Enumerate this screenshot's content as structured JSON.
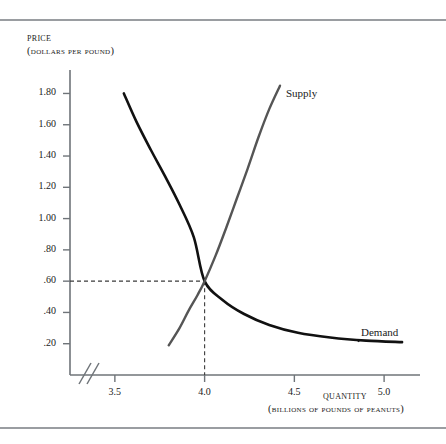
{
  "chart_data": {
    "type": "line",
    "title": "",
    "xlabel": "Quantity",
    "xlabel_units": "(billions of pounds of peanuts)",
    "ylabel": "Price",
    "ylabel_units": "(dollars per pound)",
    "xlim": [
      3.25,
      5.2
    ],
    "ylim": [
      0,
      1.95
    ],
    "grid": false,
    "axis_break_x": true,
    "legend": "inline-curve-labels",
    "xticks": [
      "3.5",
      "4.0",
      "4.5",
      "5.0"
    ],
    "xtick_values": [
      3.5,
      4.0,
      4.5,
      5.0
    ],
    "yticks": [
      "1.80",
      "1.60",
      "1.40",
      "1.20",
      "1.00",
      ".80",
      ".60",
      ".40",
      ".20"
    ],
    "ytick_values": [
      1.8,
      1.6,
      1.4,
      1.2,
      1.0,
      0.8,
      0.6,
      0.4,
      0.2
    ],
    "series": [
      {
        "name": "Demand",
        "label": "Demand",
        "color": "#111111",
        "points": [
          [
            3.55,
            1.8
          ],
          [
            3.62,
            1.62
          ],
          [
            3.7,
            1.44
          ],
          [
            3.78,
            1.27
          ],
          [
            3.86,
            1.09
          ],
          [
            3.94,
            0.88
          ],
          [
            4.0,
            0.6
          ],
          [
            4.1,
            0.48
          ],
          [
            4.22,
            0.39
          ],
          [
            4.36,
            0.32
          ],
          [
            4.52,
            0.27
          ],
          [
            4.7,
            0.24
          ],
          [
            4.9,
            0.22
          ],
          [
            5.1,
            0.21
          ]
        ]
      },
      {
        "name": "Supply",
        "label": "Supply",
        "color": "#555555",
        "points": [
          [
            3.8,
            0.19
          ],
          [
            3.86,
            0.3
          ],
          [
            3.91,
            0.41
          ],
          [
            3.96,
            0.51
          ],
          [
            4.0,
            0.6
          ],
          [
            4.06,
            0.76
          ],
          [
            4.12,
            0.94
          ],
          [
            4.18,
            1.13
          ],
          [
            4.24,
            1.32
          ],
          [
            4.3,
            1.52
          ],
          [
            4.36,
            1.7
          ],
          [
            4.42,
            1.85
          ]
        ]
      }
    ],
    "equilibrium": {
      "quantity": 4.0,
      "price": 0.6,
      "guide_style": "dashed"
    }
  }
}
